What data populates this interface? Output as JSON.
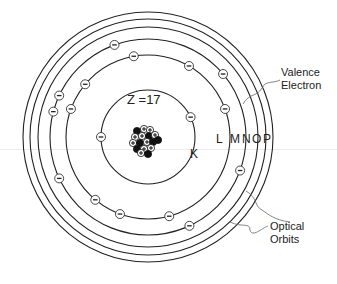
{
  "diagram": {
    "nucleus_label": "Z =17",
    "shell_labels": [
      "K",
      "L",
      "M",
      "N",
      "O",
      "P"
    ],
    "annotations": {
      "valence_line1": "Valence",
      "valence_line2": "Electron",
      "optical_line1": "Optical",
      "optical_line2": "Orbits"
    },
    "electron_symbol": "−",
    "proton_symbol": "+",
    "electron_counts": {
      "K": 2,
      "L": 8,
      "M": 7
    },
    "colors": {
      "line": "#222222",
      "background": "#ffffff",
      "neutron": "#111111"
    }
  }
}
